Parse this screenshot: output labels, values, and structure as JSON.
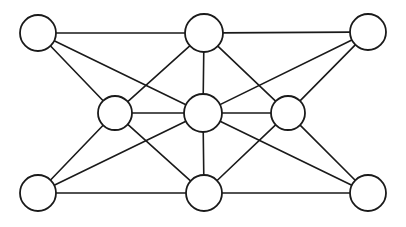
{
  "figure": {
    "title": "",
    "type": "network-graph",
    "width": 406,
    "height": 227,
    "background_color": "#ffffff",
    "node_fill_color": "#ffffff",
    "node_stroke_color": "#1a1a1a",
    "edge_color": "#1a1a1a",
    "node_stroke_width": 1.8,
    "edge_stroke_width": 1.6,
    "node_count": 8,
    "edge_count": 17
  },
  "chart_data": {
    "type": "diagram",
    "title": "",
    "xlabel": "",
    "ylabel": "",
    "nodes": [
      {
        "id": "top-left",
        "label": "",
        "x": 38,
        "y": 33,
        "r": 18
      },
      {
        "id": "top-middle",
        "label": "",
        "x": 204,
        "y": 33,
        "r": 19
      },
      {
        "id": "top-right",
        "label": "",
        "x": 368,
        "y": 32,
        "r": 18
      },
      {
        "id": "mid-left",
        "label": "",
        "x": 115,
        "y": 113,
        "r": 17
      },
      {
        "id": "center",
        "label": "",
        "x": 203,
        "y": 113,
        "r": 19
      },
      {
        "id": "mid-right",
        "label": "",
        "x": 288,
        "y": 113,
        "r": 17
      },
      {
        "id": "bottom-left",
        "label": "",
        "x": 38,
        "y": 193,
        "r": 18
      },
      {
        "id": "bottom-middle",
        "label": "",
        "x": 204,
        "y": 193,
        "r": 18
      },
      {
        "id": "bottom-right",
        "label": "",
        "x": 368,
        "y": 193,
        "r": 18
      }
    ],
    "edges": [
      {
        "source": "top-left",
        "target": "top-middle"
      },
      {
        "source": "top-left",
        "target": "mid-left"
      },
      {
        "source": "top-left",
        "target": "center"
      },
      {
        "source": "top-middle",
        "target": "top-right"
      },
      {
        "source": "top-middle",
        "target": "mid-left"
      },
      {
        "source": "top-middle",
        "target": "center"
      },
      {
        "source": "top-middle",
        "target": "mid-right"
      },
      {
        "source": "top-right",
        "target": "center"
      },
      {
        "source": "top-right",
        "target": "mid-right"
      },
      {
        "source": "mid-left",
        "target": "center"
      },
      {
        "source": "mid-left",
        "target": "bottom-left"
      },
      {
        "source": "mid-left",
        "target": "bottom-middle"
      },
      {
        "source": "center",
        "target": "mid-right"
      },
      {
        "source": "center",
        "target": "bottom-left"
      },
      {
        "source": "center",
        "target": "bottom-middle"
      },
      {
        "source": "center",
        "target": "bottom-right"
      },
      {
        "source": "mid-right",
        "target": "bottom-middle"
      },
      {
        "source": "mid-right",
        "target": "bottom-right"
      },
      {
        "source": "bottom-left",
        "target": "bottom-middle"
      },
      {
        "source": "bottom-middle",
        "target": "bottom-right"
      }
    ]
  }
}
